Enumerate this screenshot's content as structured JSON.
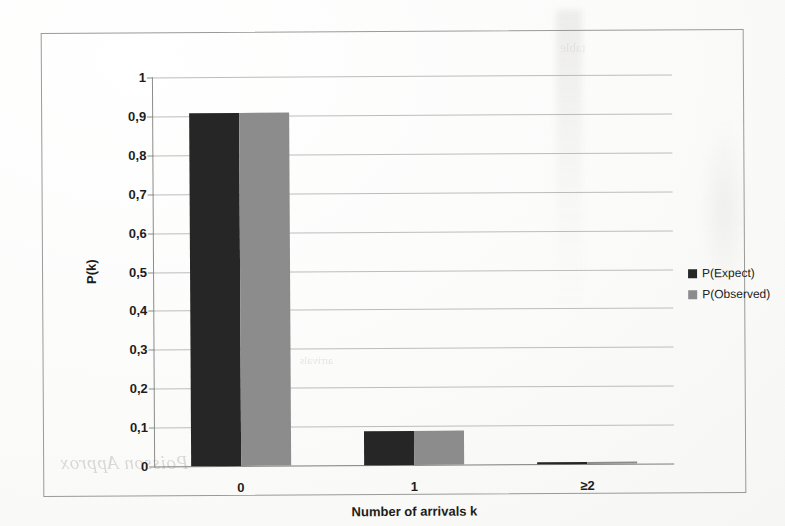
{
  "chart_data": {
    "type": "bar",
    "title": "",
    "xlabel": "Number of arrivals k",
    "ylabel": "P(k)",
    "categories": [
      "0",
      "1",
      "≥2"
    ],
    "ytick_labels": [
      "0",
      "0,1",
      "0,2",
      "0,3",
      "0,4",
      "0,5",
      "0,6",
      "0,7",
      "0,8",
      "0,9",
      "1"
    ],
    "ylim": [
      0,
      1
    ],
    "ytick_step": 0.1,
    "grid": true,
    "legend_position": "right",
    "decimal_separator": ",",
    "series": [
      {
        "name": "P(Expect)",
        "color": "#262626",
        "values": [
          0.908,
          0.087,
          0.005
        ]
      },
      {
        "name": "P(Observed)",
        "color": "#8c8c8c",
        "values": [
          0.908,
          0.087,
          0.005
        ]
      }
    ]
  },
  "legend": {
    "entries": [
      {
        "label": "P(Expect)",
        "color": "#262626"
      },
      {
        "label": "P(Observed)",
        "color": "#8c8c8c"
      }
    ]
  },
  "scan_artifacts": {
    "bleed_text_a": "Poisson Approx",
    "bleed_text_b": "arrivals",
    "bleed_text_c": "table"
  }
}
